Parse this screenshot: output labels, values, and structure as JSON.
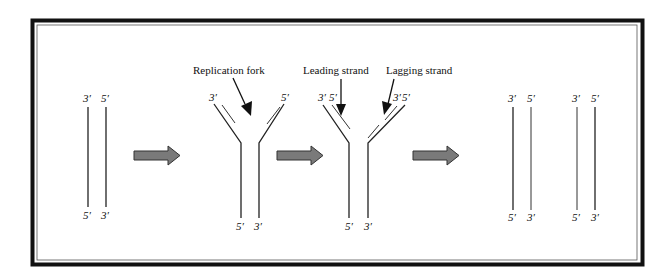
{
  "figure": {
    "type": "dna-replication-diagram",
    "stages": [
      {
        "name": "parent-duplex",
        "top_labels": [
          "3′",
          "5′"
        ],
        "bottom_labels": [
          "5′",
          "3′"
        ]
      },
      {
        "name": "replication-fork",
        "top_labels": [
          "3′",
          "5′"
        ],
        "bottom_labels": [
          "5′",
          "3′"
        ],
        "callout": "Replication fork"
      },
      {
        "name": "leading-lagging",
        "top_labels": [
          "3′",
          "5′",
          "3′",
          "5′"
        ],
        "bottom_labels": [
          "5′",
          "3′"
        ],
        "callouts": [
          "Leading strand",
          "Lagging strand"
        ]
      },
      {
        "name": "daughter-duplexes",
        "top_labels": [
          "3′",
          "5′",
          "3′",
          "5′"
        ],
        "bottom_labels": [
          "5′",
          "3′",
          "5′",
          "3′"
        ]
      }
    ],
    "labels": {
      "replication_fork": "Replication fork",
      "leading_strand": "Leading strand",
      "lagging_strand": "Lagging strand",
      "three_prime": "3′",
      "five_prime": "5′"
    },
    "colors": {
      "frame": "#111111",
      "arrow_fill": "#7a7a7a",
      "strand": "#222222"
    }
  }
}
